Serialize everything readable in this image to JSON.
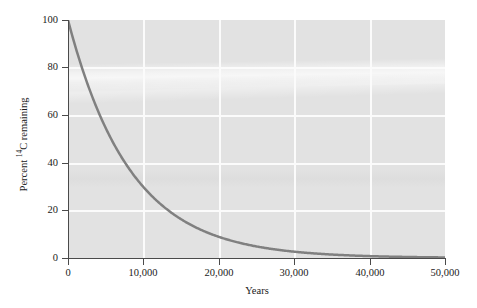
{
  "chart_data": {
    "type": "line",
    "title": "",
    "subtitle": "",
    "xlabel": "Years",
    "ylabel_plain": "Percent 14C remaining",
    "ylabel_prefix": "Percent ",
    "ylabel_superscript": "14",
    "ylabel_suffix": "C remaining",
    "xlim": [
      0,
      50000
    ],
    "ylim": [
      0,
      100
    ],
    "x_tick_labels": [
      "0",
      "10,000",
      "20,000",
      "30,000",
      "40,000",
      "50,000"
    ],
    "x_tick_values": [
      0,
      10000,
      20000,
      30000,
      40000,
      50000
    ],
    "y_tick_labels": [
      "0",
      "20",
      "40",
      "60",
      "80",
      "100"
    ],
    "y_tick_values": [
      0,
      20,
      40,
      60,
      80,
      100
    ],
    "grid": true,
    "grid_color": "#fbfbfb",
    "plot_background": "#e2e2e2",
    "legend": null,
    "series": [
      {
        "name": "Percent 14C remaining",
        "color": "#808080",
        "line_width": 2.5,
        "half_life_years": 5730,
        "model": "exponential decay: y = 100 * 0.5^(x/5730)",
        "x": [
          0,
          1000,
          2000,
          3000,
          4000,
          5000,
          5730,
          6000,
          7000,
          8000,
          9000,
          10000,
          11460,
          12000,
          14000,
          16000,
          17190,
          18000,
          20000,
          22000,
          22920,
          24000,
          26000,
          28000,
          28650,
          30000,
          32000,
          34000,
          34380,
          36000,
          38000,
          40000,
          40110,
          42000,
          44000,
          45840,
          46000,
          48000,
          50000
        ],
        "y": [
          100.0,
          88.6,
          78.5,
          69.6,
          61.6,
          54.6,
          50.0,
          48.4,
          42.9,
          38.0,
          33.6,
          29.8,
          25.0,
          23.4,
          18.4,
          14.5,
          12.5,
          11.4,
          9.0,
          7.1,
          6.25,
          5.6,
          4.4,
          3.5,
          3.13,
          2.7,
          2.1,
          1.7,
          1.56,
          1.3,
          1.0,
          0.8,
          0.78,
          0.6,
          0.5,
          0.39,
          0.39,
          0.3,
          0.24
        ],
        "path_points_px": [
          [
            0,
            1
          ],
          [
            4,
            20
          ],
          [
            9,
            40
          ],
          [
            15,
            60
          ],
          [
            22,
            80
          ],
          [
            30,
            98
          ],
          [
            38,
            113
          ],
          [
            47,
            127
          ],
          [
            57,
            140
          ],
          [
            68,
            152
          ],
          [
            79,
            163
          ],
          [
            91,
            173
          ],
          [
            104,
            182
          ],
          [
            117,
            190
          ],
          [
            130,
            197
          ],
          [
            143,
            203
          ],
          [
            157,
            209
          ],
          [
            170,
            213
          ],
          [
            184,
            217
          ],
          [
            198,
            221
          ],
          [
            212,
            224
          ],
          [
            226,
            227
          ],
          [
            240,
            229
          ],
          [
            254,
            231
          ],
          [
            268,
            232
          ],
          [
            282,
            233
          ],
          [
            296,
            234
          ],
          [
            310,
            235
          ],
          [
            324,
            235
          ],
          [
            338,
            236
          ],
          [
            352,
            236
          ],
          [
            366,
            236
          ],
          [
            377,
            237
          ]
        ]
      }
    ]
  },
  "axis": {
    "y_label_positions_px": [
      258,
      210,
      163,
      115,
      67,
      20
    ],
    "x_label_positions_px": [
      68,
      143,
      219,
      294,
      370,
      445
    ]
  }
}
